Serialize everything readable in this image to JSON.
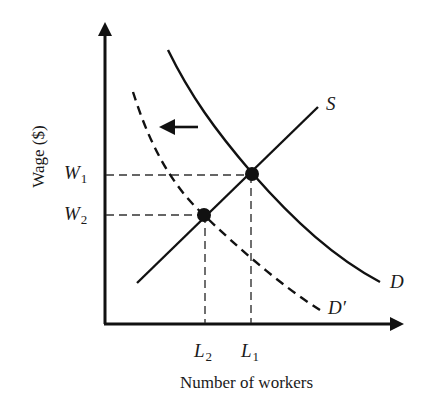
{
  "diagram": {
    "type": "labor-market supply and demand",
    "axes": {
      "x_label": "Number of workers",
      "y_label": "Wage ($)"
    },
    "curves": [
      {
        "id": "supply",
        "label": "S",
        "style": "solid"
      },
      {
        "id": "demand",
        "label": "D",
        "style": "solid"
      },
      {
        "id": "demand_shifted",
        "label": "D′",
        "style": "dashed"
      }
    ],
    "shift_arrow": {
      "direction": "left",
      "meaning": "demand decreases from D to D′"
    },
    "equilibria": [
      {
        "id": "eq1",
        "wage": {
          "symbol": "W",
          "sub": "1"
        },
        "quantity": {
          "symbol": "L",
          "sub": "1"
        },
        "on_curves": [
          "S",
          "D"
        ]
      },
      {
        "id": "eq2",
        "wage": {
          "symbol": "W",
          "sub": "2"
        },
        "quantity": {
          "symbol": "L",
          "sub": "2"
        },
        "on_curves": [
          "S",
          "D′"
        ]
      }
    ],
    "colors": {
      "ink": "#111111",
      "dashed_guides": "#444444",
      "background": "#ffffff"
    }
  },
  "labels": {
    "S": "S",
    "D": "D",
    "D_prime": "D′",
    "W": "W",
    "L": "L",
    "sub1": "1",
    "sub2": "2",
    "x_title": "Number of workers",
    "y_title": "Wage ($)"
  }
}
